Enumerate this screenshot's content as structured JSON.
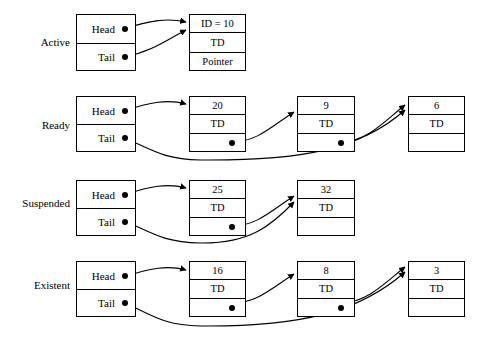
{
  "diagram": {
    "pointer_cell_labels": {
      "head": "Head",
      "tail": "Tail"
    },
    "node_td_label": "TD",
    "rows": [
      {
        "state_label": "Active",
        "head_label": "Head",
        "tail_label": "Tail",
        "nodes": [
          {
            "id_text": "ID = 10",
            "td_text": "TD",
            "ptr_text": "Pointer",
            "has_ptr_dot": false
          }
        ]
      },
      {
        "state_label": "Ready",
        "head_label": "Head",
        "tail_label": "Tail",
        "nodes": [
          {
            "id_text": "20",
            "td_text": "TD",
            "ptr_text": "",
            "has_ptr_dot": true
          },
          {
            "id_text": "9",
            "td_text": "TD",
            "ptr_text": "",
            "has_ptr_dot": true
          },
          {
            "id_text": "6",
            "td_text": "TD",
            "ptr_text": "",
            "has_ptr_dot": false
          }
        ]
      },
      {
        "state_label": "Suspended",
        "head_label": "Head",
        "tail_label": "Tail",
        "nodes": [
          {
            "id_text": "25",
            "td_text": "TD",
            "ptr_text": "",
            "has_ptr_dot": true
          },
          {
            "id_text": "32",
            "td_text": "TD",
            "ptr_text": "",
            "has_ptr_dot": false
          }
        ]
      },
      {
        "state_label": "Existent",
        "head_label": "Head",
        "tail_label": "Tail",
        "nodes": [
          {
            "id_text": "16",
            "td_text": "TD",
            "ptr_text": "",
            "has_ptr_dot": true
          },
          {
            "id_text": "8",
            "td_text": "TD",
            "ptr_text": "",
            "has_ptr_dot": true
          },
          {
            "id_text": "3",
            "td_text": "TD",
            "ptr_text": "",
            "has_ptr_dot": false
          }
        ]
      }
    ],
    "colors": {
      "line": "#000000",
      "background": "#ffffff"
    }
  }
}
